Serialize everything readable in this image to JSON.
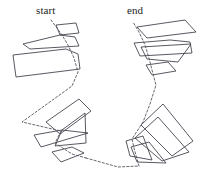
{
  "figure": {
    "background_color": "#ffffff",
    "stroke_color": "#3b3b46",
    "path_color": "#55555f",
    "width": 211,
    "height": 182
  },
  "labels": {
    "start": "start",
    "end": "end"
  },
  "chart_data": {
    "type": "diagram",
    "xlabel": "",
    "ylabel": "",
    "xlim": [
      0,
      211
    ],
    "ylim": [
      0,
      182
    ],
    "grid": false,
    "legend": "none",
    "annotations": [
      {
        "text": "start",
        "x": 36,
        "y": 5
      },
      {
        "text": "end",
        "x": 127,
        "y": 5
      }
    ],
    "series": [
      {
        "name": "polygons",
        "type": "closed-polygons",
        "stroke": "#3b3b46",
        "values": [
          {
            "id": "left-p1",
            "points": "56,25 76,23 79,33 60,35"
          },
          {
            "id": "left-p2",
            "points": "23,44 60,35 75,37 79,46 30,49"
          },
          {
            "id": "left-p3",
            "points": "13,55 66,49 78,54 80,69 16,77"
          },
          {
            "id": "left-p4",
            "points": "46,122 79,99 91,111 60,134"
          },
          {
            "id": "left-p5",
            "points": "34,135 62,130 88,133 41,147"
          },
          {
            "id": "left-p6",
            "points": "62,130 85,113 86,143 55,146"
          },
          {
            "id": "left-p7",
            "points": "52,152 72,147 84,153 61,162"
          },
          {
            "id": "right-p1",
            "points": "137,27 185,20 196,32 147,38"
          },
          {
            "id": "right-p2",
            "points": "134,43 170,40 190,42 192,53 140,56"
          },
          {
            "id": "right-p3",
            "points": "141,47 191,44 178,62 147,59"
          },
          {
            "id": "right-p4",
            "points": "146,65 168,62 176,71 152,75"
          },
          {
            "id": "right-p5",
            "points": "141,125 163,104 193,141 172,156"
          },
          {
            "id": "right-p6",
            "points": "135,138 158,117 189,152 162,161"
          },
          {
            "id": "right-p7",
            "points": "126,141 143,136 152,160 130,156"
          },
          {
            "id": "right-p8",
            "points": "131,147 149,142 166,163 137,162"
          }
        ]
      },
      {
        "name": "traversal-path",
        "type": "dashed-polyline",
        "stroke": "#55555f",
        "dash": "2.2 2.0",
        "values": [
          {
            "id": "left-path",
            "points": "51,20 62,35 68,45 74,58 78,72 72,86 22,122 61,131 55,143 72,154 86,158"
          },
          {
            "id": "connector",
            "points": "86,158 118,167 139,166"
          },
          {
            "id": "right-path",
            "points": "139,166 134,148 132,139 143,122 150,104 156,85 152,70 149,58 145,45 139,32 133,22"
          }
        ]
      }
    ]
  }
}
